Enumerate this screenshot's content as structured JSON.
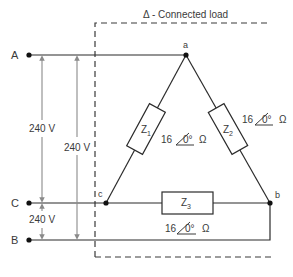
{
  "diagram": {
    "title": "Δ - Connected load",
    "terminals": [
      {
        "id": "A",
        "label": "A"
      },
      {
        "id": "C",
        "label": "C"
      },
      {
        "id": "B",
        "label": "B"
      }
    ],
    "nodes": [
      {
        "id": "a",
        "label": "a"
      },
      {
        "id": "b",
        "label": "b"
      },
      {
        "id": "c",
        "label": "c"
      }
    ],
    "voltages": [
      {
        "id": "v_ac",
        "label": "240 V"
      },
      {
        "id": "v_ab",
        "label": "240 V"
      },
      {
        "id": "v_cb",
        "label": "240 V"
      }
    ],
    "impedances": [
      {
        "id": "Z1",
        "name": "Z",
        "sub": "1",
        "magnitude": "16",
        "angle": "0°",
        "unit": "Ω"
      },
      {
        "id": "Z2",
        "name": "Z",
        "sub": "2",
        "magnitude": "16",
        "angle": "0°",
        "unit": "Ω"
      },
      {
        "id": "Z3",
        "name": "Z",
        "sub": "3",
        "magnitude": "16",
        "angle": "0°",
        "unit": "Ω"
      }
    ],
    "colors": {
      "wire": "#2b2b2b",
      "arrow": "#8a8a8a",
      "dashed": "#3a3a3a",
      "text": "#3a3a3a"
    }
  }
}
